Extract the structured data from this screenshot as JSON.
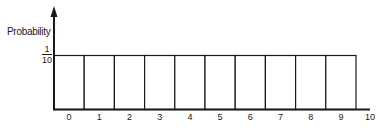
{
  "chart_data": {
    "type": "bar",
    "title": "",
    "xlabel": "",
    "ylabel": "Probability",
    "categories": [
      "0",
      "1",
      "2",
      "3",
      "4",
      "5",
      "6",
      "7",
      "8",
      "9"
    ],
    "values": [
      0.1,
      0.1,
      0.1,
      0.1,
      0.1,
      0.1,
      0.1,
      0.1,
      0.1,
      0.1
    ],
    "x_tick_labels": [
      "0",
      "1",
      "2",
      "3",
      "4",
      "5",
      "6",
      "7",
      "8",
      "9",
      "10"
    ],
    "y_tick_labels": [
      {
        "numerator": "1",
        "denominator": "10",
        "value": 0.1
      }
    ],
    "ylim": [
      0,
      0.17
    ],
    "grid": false,
    "legend": null,
    "bar_fill": "#ffffff",
    "bar_edge_color": "#1a1a1a"
  },
  "labels": {
    "ylabel": "Probability",
    "ytick_numerator": "1",
    "ytick_denominator": "10"
  }
}
